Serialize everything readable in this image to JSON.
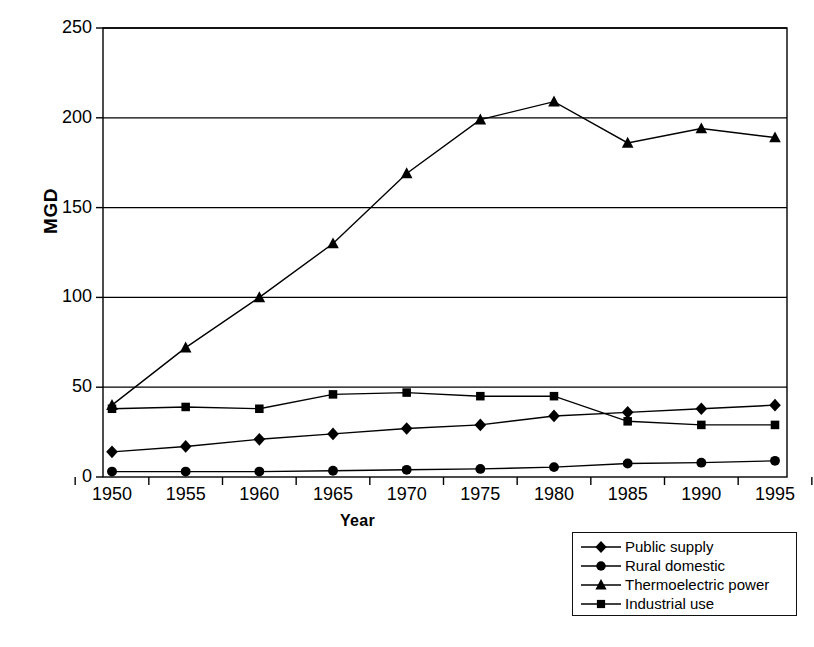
{
  "chart_data": {
    "type": "line",
    "title": "",
    "xlabel": "Year",
    "ylabel": "MGD",
    "x": [
      1950,
      1955,
      1960,
      1965,
      1970,
      1975,
      1980,
      1985,
      1990,
      1995
    ],
    "xtick_labels": [
      "1950",
      "1955",
      "1960",
      "1965",
      "1970",
      "1975",
      "1980",
      "1985",
      "1990",
      "1995"
    ],
    "ytick_labels": [
      "0",
      "50",
      "100",
      "150",
      "200",
      "250"
    ],
    "yticks": [
      0,
      50,
      100,
      150,
      200,
      250
    ],
    "ylim": [
      0,
      250
    ],
    "grid": "horizontal",
    "legend_position": "bottom-right",
    "series": [
      {
        "name": "Public supply",
        "marker": "diamond",
        "values": [
          14,
          17,
          21,
          24,
          27,
          29,
          34,
          36,
          38,
          40
        ]
      },
      {
        "name": "Rural domestic",
        "marker": "circle",
        "values": [
          3,
          3,
          3,
          3.5,
          4,
          4.5,
          5.5,
          7.5,
          8,
          9
        ]
      },
      {
        "name": "Thermoelectric power",
        "marker": "triangle",
        "values": [
          40,
          72,
          100,
          130,
          169,
          199,
          209,
          186,
          194,
          189
        ]
      },
      {
        "name": "Industrial use",
        "marker": "square",
        "values": [
          38,
          39,
          38,
          46,
          47,
          45,
          45,
          31,
          29,
          29
        ]
      }
    ],
    "colors": {
      "line": "#000000",
      "marker": "#000000",
      "grid": "#000000",
      "axis": "#000000",
      "background": "#ffffff"
    }
  },
  "legend": {
    "items": [
      {
        "label": "Public supply",
        "marker": "diamond"
      },
      {
        "label": "Rural domestic",
        "marker": "circle"
      },
      {
        "label": "Thermoelectric power",
        "marker": "triangle"
      },
      {
        "label": "Industrial use",
        "marker": "square"
      }
    ]
  }
}
